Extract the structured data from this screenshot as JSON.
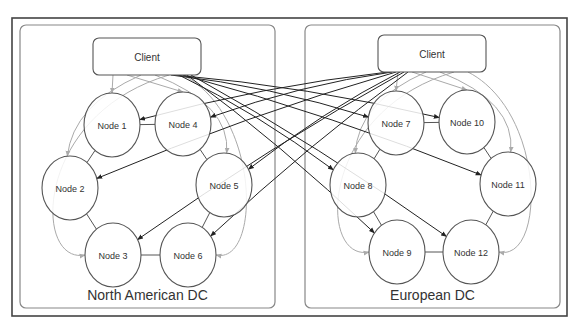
{
  "diagram": {
    "colors": {
      "frame": "#444444",
      "dc_box": "#888888",
      "node_stroke": "#555555",
      "arrow_dark": "#222222",
      "arrow_light": "#aaaaaa",
      "text": "#333333"
    },
    "datacenters": [
      {
        "id": "na",
        "label": "North American DC",
        "client_label": "Client",
        "box": {
          "x": 20,
          "y": 25,
          "w": 255,
          "h": 283
        },
        "client": {
          "x": 93,
          "y": 38,
          "w": 108,
          "h": 37
        },
        "nodes": [
          {
            "id": "n1",
            "label": "Node 1",
            "cx": 112,
            "cy": 125
          },
          {
            "id": "n4",
            "label": "Node 4",
            "cx": 183,
            "cy": 124
          },
          {
            "id": "n2",
            "label": "Node 2",
            "cx": 70,
            "cy": 188
          },
          {
            "id": "n5",
            "label": "Node 5",
            "cx": 224,
            "cy": 185
          },
          {
            "id": "n3",
            "label": "Node 3",
            "cx": 113,
            "cy": 255
          },
          {
            "id": "n6",
            "label": "Node 6",
            "cx": 188,
            "cy": 255
          }
        ]
      },
      {
        "id": "eu",
        "label": "European DC",
        "client_label": "Client",
        "box": {
          "x": 305,
          "y": 25,
          "w": 255,
          "h": 283
        },
        "client": {
          "x": 378,
          "y": 35,
          "w": 108,
          "h": 37
        },
        "nodes": [
          {
            "id": "n7",
            "label": "Node 7",
            "cx": 396,
            "cy": 123
          },
          {
            "id": "n10",
            "label": "Node 10",
            "cx": 467,
            "cy": 122
          },
          {
            "id": "n8",
            "label": "Node 8",
            "cx": 358,
            "cy": 185
          },
          {
            "id": "n11",
            "label": "Node 11",
            "cx": 508,
            "cy": 184
          },
          {
            "id": "n9",
            "label": "Node 9",
            "cx": 397,
            "cy": 252
          },
          {
            "id": "n12",
            "label": "Node 12",
            "cx": 471,
            "cy": 252
          }
        ]
      }
    ],
    "ring_edges": [
      [
        "n1",
        "n4"
      ],
      [
        "n4",
        "n5"
      ],
      [
        "n5",
        "n6"
      ],
      [
        "n6",
        "n3"
      ],
      [
        "n3",
        "n2"
      ],
      [
        "n2",
        "n1"
      ],
      [
        "n7",
        "n10"
      ],
      [
        "n10",
        "n11"
      ],
      [
        "n11",
        "n12"
      ],
      [
        "n12",
        "n9"
      ],
      [
        "n9",
        "n8"
      ],
      [
        "n8",
        "n7"
      ]
    ],
    "local_edges": [
      {
        "from": "na",
        "to": "n1"
      },
      {
        "from": "na",
        "to": "n4"
      },
      {
        "from": "na",
        "to": "n2"
      },
      {
        "from": "na",
        "to": "n5"
      },
      {
        "from": "na",
        "to": "n3"
      },
      {
        "from": "na",
        "to": "n6"
      },
      {
        "from": "eu",
        "to": "n7"
      },
      {
        "from": "eu",
        "to": "n10"
      },
      {
        "from": "eu",
        "to": "n8"
      },
      {
        "from": "eu",
        "to": "n11"
      },
      {
        "from": "eu",
        "to": "n9"
      },
      {
        "from": "eu",
        "to": "n12"
      }
    ],
    "cross_edges": [
      {
        "from": "na",
        "to": "n7"
      },
      {
        "from": "na",
        "to": "n10"
      },
      {
        "from": "na",
        "to": "n8"
      },
      {
        "from": "na",
        "to": "n11"
      },
      {
        "from": "na",
        "to": "n9"
      },
      {
        "from": "na",
        "to": "n12"
      },
      {
        "from": "eu",
        "to": "n1"
      },
      {
        "from": "eu",
        "to": "n4"
      },
      {
        "from": "eu",
        "to": "n2"
      },
      {
        "from": "eu",
        "to": "n5"
      },
      {
        "from": "eu",
        "to": "n3"
      },
      {
        "from": "eu",
        "to": "n6"
      }
    ]
  }
}
